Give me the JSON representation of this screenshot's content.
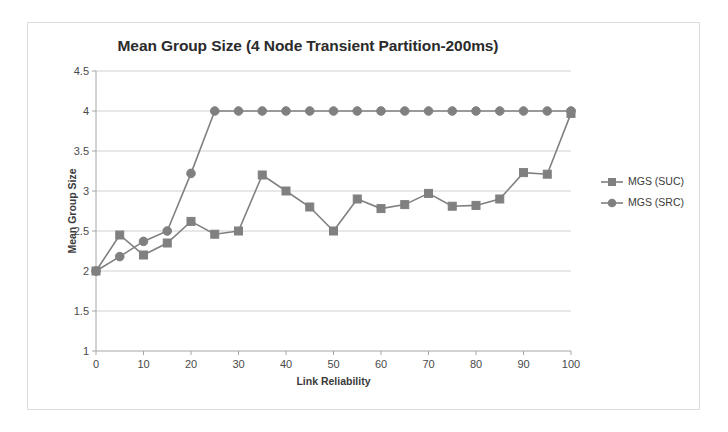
{
  "chart_data": {
    "type": "line",
    "title": "Mean Group Size (4 Node Transient Partition-200ms)",
    "xlabel": "Link Reliability",
    "ylabel": "Mean Group Size",
    "xlim": [
      0,
      100
    ],
    "ylim": [
      1,
      4.5
    ],
    "xticks": [
      0,
      10,
      20,
      30,
      40,
      50,
      60,
      70,
      80,
      90,
      100
    ],
    "xtick_labels": [
      "0",
      "10",
      "20",
      "30",
      "40",
      "50",
      "60",
      "70",
      "80",
      "90",
      "100"
    ],
    "yticks": [
      1,
      1.5,
      2,
      2.5,
      3,
      3.5,
      4,
      4.5
    ],
    "ytick_labels": [
      "1",
      "1.5",
      "2",
      "2.5",
      "3",
      "3.5",
      "4",
      "4.5"
    ],
    "grid": "horizontal",
    "legend_position": "right",
    "x": [
      0,
      5,
      10,
      15,
      20,
      25,
      30,
      35,
      40,
      45,
      50,
      55,
      60,
      65,
      70,
      75,
      80,
      85,
      90,
      95,
      100
    ],
    "series": [
      {
        "name": "MGS (SUC)",
        "marker": "square",
        "color": "#808080",
        "values": [
          2.0,
          2.45,
          2.2,
          2.35,
          2.62,
          2.46,
          2.5,
          3.2,
          3.0,
          2.8,
          2.5,
          2.9,
          2.78,
          2.83,
          2.97,
          2.81,
          2.82,
          2.9,
          3.23,
          3.21,
          3.97
        ]
      },
      {
        "name": "MGS (SRC)",
        "marker": "circle",
        "color": "#808080",
        "values": [
          2.0,
          2.18,
          2.37,
          2.5,
          3.22,
          4.0,
          4.0,
          4.0,
          4.0,
          4.0,
          4.0,
          4.0,
          4.0,
          4.0,
          4.0,
          4.0,
          4.0,
          4.0,
          4.0,
          4.0,
          4.0
        ]
      }
    ]
  },
  "style": {
    "grid_color": "#d0d0d0",
    "axis_color": "#a6a6a6",
    "frame_color": "#dcdcdc",
    "text_color": "#3a3a3a"
  }
}
